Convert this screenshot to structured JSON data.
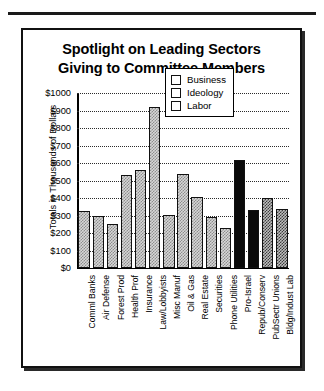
{
  "chart_data": {
    "type": "bar",
    "title": "Spotlight on Leading Sectors Giving to Committee Members",
    "title_lines": [
      "Spotlight on Leading Sectors",
      "Giving to Committee Members"
    ],
    "xlabel": "",
    "ylabel": "Totals in Thousands of Dollars",
    "ylim": [
      0,
      1000
    ],
    "ytick_values": [
      1000,
      900,
      800,
      700,
      600,
      500,
      400,
      300,
      200,
      100,
      0
    ],
    "ytick_labels": [
      "$1000",
      "$900",
      "$800",
      "$700",
      "$600",
      "$500",
      "$400",
      "$300",
      "$200",
      "$100",
      "$0"
    ],
    "grid": true,
    "legend_position": "upper right",
    "legend": [
      "Business",
      "Ideology",
      "Labor"
    ],
    "categories": [
      "Comml Banks",
      "Air Defense",
      "Forest Prod",
      "Health Prof",
      "Insurance",
      "Law/Lobbyists",
      "Misc Manuf",
      "Oil & Gas",
      "Real Estate",
      "Securities",
      "Phone Utilities",
      "Pro-Israel",
      "Repub/Conserv",
      "PubSectr Unions",
      "Bldg/Indust Lab"
    ],
    "values": [
      325,
      300,
      250,
      530,
      560,
      920,
      305,
      540,
      405,
      290,
      230,
      620,
      330,
      400,
      340
    ],
    "groups": [
      "Business",
      "Business",
      "Business",
      "Business",
      "Business",
      "Business",
      "Business",
      "Business",
      "Business",
      "Business",
      "Business",
      "Ideology",
      "Ideology",
      "Labor",
      "Labor"
    ]
  }
}
